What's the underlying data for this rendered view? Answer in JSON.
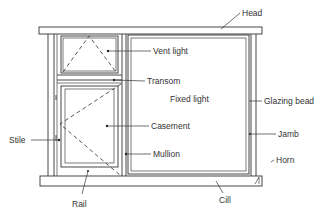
{
  "diagram": {
    "type": "window-elevation",
    "colors": {
      "line": "#333333",
      "background": "#ffffff"
    },
    "labels": {
      "head": "Head",
      "vent_light": "Vent light",
      "transom": "Transom",
      "fixed_light": "Fixed light",
      "glazing_bead": "Glazing bead",
      "stile": "Stile",
      "casement": "Casement",
      "jamb": "Jamb",
      "mullion": "Mullion",
      "horn": "Horn",
      "rail": "Rail",
      "cill": "Cill"
    }
  }
}
